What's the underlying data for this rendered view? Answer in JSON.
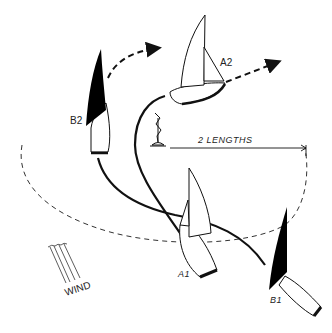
{
  "diagram": {
    "type": "sailing-mark-rounding",
    "labels": {
      "boat_a1": "A1",
      "boat_a2": "A2",
      "boat_b1": "B1",
      "boat_b2": "B2",
      "zone": "2 LENGTHS",
      "wind": "WIND"
    },
    "colors": {
      "ink": "#111111",
      "background": "#ffffff",
      "sail_dark": "#000000",
      "sail_light": "#ffffff"
    },
    "elements": [
      {
        "id": "mark",
        "desc": "rounding mark buoy"
      },
      {
        "id": "zone-circle",
        "desc": "dashed two-length zone circle"
      },
      {
        "id": "track-a",
        "desc": "solid track from A1 to A2"
      },
      {
        "id": "track-b",
        "desc": "solid track from B1 to B2"
      },
      {
        "id": "arrow-a2",
        "desc": "dashed arrow ahead of A2"
      },
      {
        "id": "arrow-b2",
        "desc": "dashed arrow ahead of B2"
      },
      {
        "id": "wind-indicator",
        "desc": "wind streak lines"
      }
    ]
  }
}
